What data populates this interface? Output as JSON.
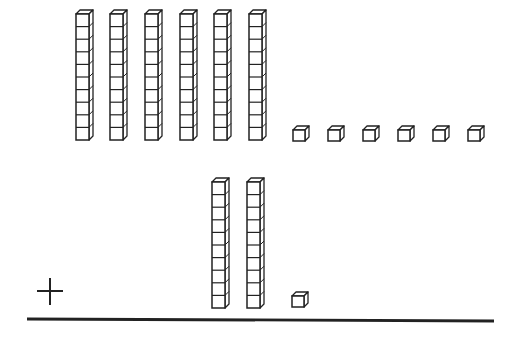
{
  "problem": {
    "type": "base-ten-blocks-addition",
    "operator": "+",
    "addend_top": {
      "tens_rods": 6,
      "ones_cubes": 6,
      "value": 66
    },
    "addend_bottom": {
      "tens_rods": 2,
      "ones_cubes": 1,
      "value": 21
    },
    "cubes_per_rod": 10
  },
  "colors": {
    "stroke": "#222222",
    "fill": "#ffffff",
    "background": "#ffffff"
  },
  "layout": {
    "top_rods_x": [
      76,
      110,
      145,
      180,
      214,
      249
    ],
    "top_rods_y": 10,
    "top_ones_x": [
      293,
      328,
      363,
      398,
      433,
      468
    ],
    "top_ones_y": 126,
    "bottom_rods_x": [
      212,
      247
    ],
    "bottom_rods_y": 178,
    "bottom_ones_x": [
      292
    ],
    "bottom_ones_y": 292,
    "plus_center": [
      50,
      291
    ],
    "line": {
      "x1": 27,
      "y1": 319,
      "x2": 494,
      "y2": 321
    }
  }
}
